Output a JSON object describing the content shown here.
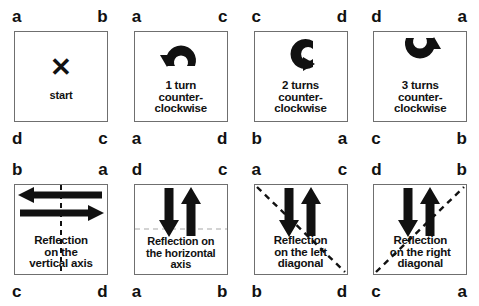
{
  "figure": {
    "letters": [
      "a",
      "b",
      "c",
      "d"
    ],
    "colors": {
      "ink": "#111111",
      "square_border": "#6f6f6f",
      "background": "#ffffff"
    }
  },
  "cells": [
    {
      "id": "start",
      "corners": {
        "tl": "a",
        "tr": "b",
        "bl": "d",
        "br": "c"
      },
      "icon": "x-mark-icon",
      "icon_glyph": "✕",
      "caption": "start"
    },
    {
      "id": "rotation-1",
      "corners": {
        "tl": "a",
        "tr": "c",
        "bl": "a",
        "br": "d"
      },
      "icon": "rotate-counterclockwise-icon",
      "caption": "1 turn counter-clockwise",
      "caption_lines": [
        "1 turn",
        "counter-",
        "clockwise"
      ]
    },
    {
      "id": "rotation-2",
      "corners": {
        "tl": "c",
        "tr": "d",
        "bl": "b",
        "br": "a"
      },
      "icon": "rotate-counterclockwise-icon",
      "caption": "2 turns counter-clockwise",
      "caption_lines": [
        "2 turns",
        "counter-",
        "clockwise"
      ]
    },
    {
      "id": "rotation-3",
      "corners": {
        "tl": "d",
        "tr": "a",
        "bl": "c",
        "br": "b"
      },
      "icon": "rotate-counterclockwise-icon",
      "caption": "3 turns counter-clockwise",
      "caption_lines": [
        "3 turns",
        "counter-",
        "clockwise"
      ]
    },
    {
      "id": "reflection-vertical",
      "corners": {
        "tl": "b",
        "tr": "a",
        "bl": "c",
        "br": "d"
      },
      "icon": "horizontal-double-arrow-icon",
      "axis": "vertical-dashed-axis",
      "caption": "Reflection on the vertical axis",
      "caption_lines": [
        "Reflection",
        "on the",
        "vertical axis"
      ]
    },
    {
      "id": "reflection-horizontal",
      "corners": {
        "tl": "d",
        "tr": "c",
        "bl": "a",
        "br": "b"
      },
      "icon": "vertical-double-arrow-icon",
      "axis": "horizontal-dashed-axis",
      "caption": "Reflection on the horizontal axis",
      "caption_lines": [
        "Reflection on",
        "the horizontal",
        "axis"
      ]
    },
    {
      "id": "reflection-left-diagonal",
      "corners": {
        "tl": "a",
        "tr": "c",
        "bl": "b",
        "br": "d"
      },
      "icon": "vertical-double-arrow-icon",
      "axis": "left-diagonal-dashed-axis",
      "caption": "Reflection on the left diagonal",
      "caption_lines": [
        "Reflection",
        "on the left",
        "diagonal"
      ]
    },
    {
      "id": "reflection-right-diagonal",
      "corners": {
        "tl": "d",
        "tr": "b",
        "bl": "c",
        "br": "a"
      },
      "icon": "vertical-double-arrow-icon",
      "axis": "right-diagonal-dashed-axis",
      "caption": "Reflection on the right diagonal",
      "caption_lines": [
        "Reflection",
        "on the right",
        "diagonal"
      ]
    }
  ]
}
